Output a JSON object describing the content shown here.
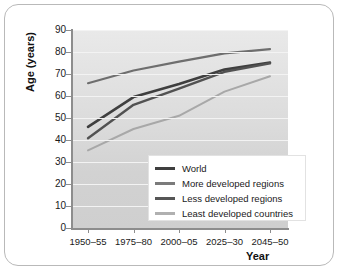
{
  "figure": {
    "frame_border_color": "#b9b9b9",
    "plot_bg_top": "#e9e9e9",
    "plot_bg_bottom": "#cfcfcf",
    "gridline_color": "#f3f3f3",
    "axis_color": "#8d8d8d"
  },
  "chart_data": {
    "type": "line",
    "title": "",
    "xlabel": "Year",
    "ylabel": "Age (years)",
    "categories": [
      "1950–55",
      "1975–80",
      "2000–05",
      "2025–30",
      "2045–50"
    ],
    "x_tick_labels": [
      "1950–55",
      "1975–80",
      "2000–05",
      "2025–30",
      "2045–50"
    ],
    "y_tick_labels": [
      "0",
      "10",
      "20",
      "30",
      "40",
      "50",
      "60",
      "70",
      "80",
      "90"
    ],
    "ylim": [
      0,
      90
    ],
    "y_step": 10,
    "grid": "horizontal",
    "legend_position": "inside-bottom-right",
    "series": [
      {
        "name": "World",
        "color": "#3f3f3f",
        "width": 2.6,
        "values": [
          46.0,
          59.5,
          65.5,
          72.0,
          75.2
        ]
      },
      {
        "name": "More developed regions",
        "color": "#6e6e6e",
        "width": 2.2,
        "values": [
          65.8,
          71.6,
          75.6,
          79.4,
          81.3
        ]
      },
      {
        "name": "Less developed regions",
        "color": "#525252",
        "width": 2.4,
        "values": [
          40.8,
          56.0,
          63.3,
          71.0,
          74.8
        ]
      },
      {
        "name": "Least developed countries",
        "color": "#a8a8a8",
        "width": 2.0,
        "values": [
          35.3,
          45.0,
          51.0,
          62.0,
          69.0
        ]
      }
    ]
  },
  "legend": {
    "items": [
      {
        "label": "World",
        "color": "#3f3f3f",
        "width": 3.2
      },
      {
        "label": "More developed regions",
        "color": "#7b7b7b",
        "width": 2.6
      },
      {
        "label": "Less developed regions",
        "color": "#565656",
        "width": 2.8
      },
      {
        "label": "Least developed countries",
        "color": "#b0b0b0",
        "width": 2.2
      }
    ]
  }
}
